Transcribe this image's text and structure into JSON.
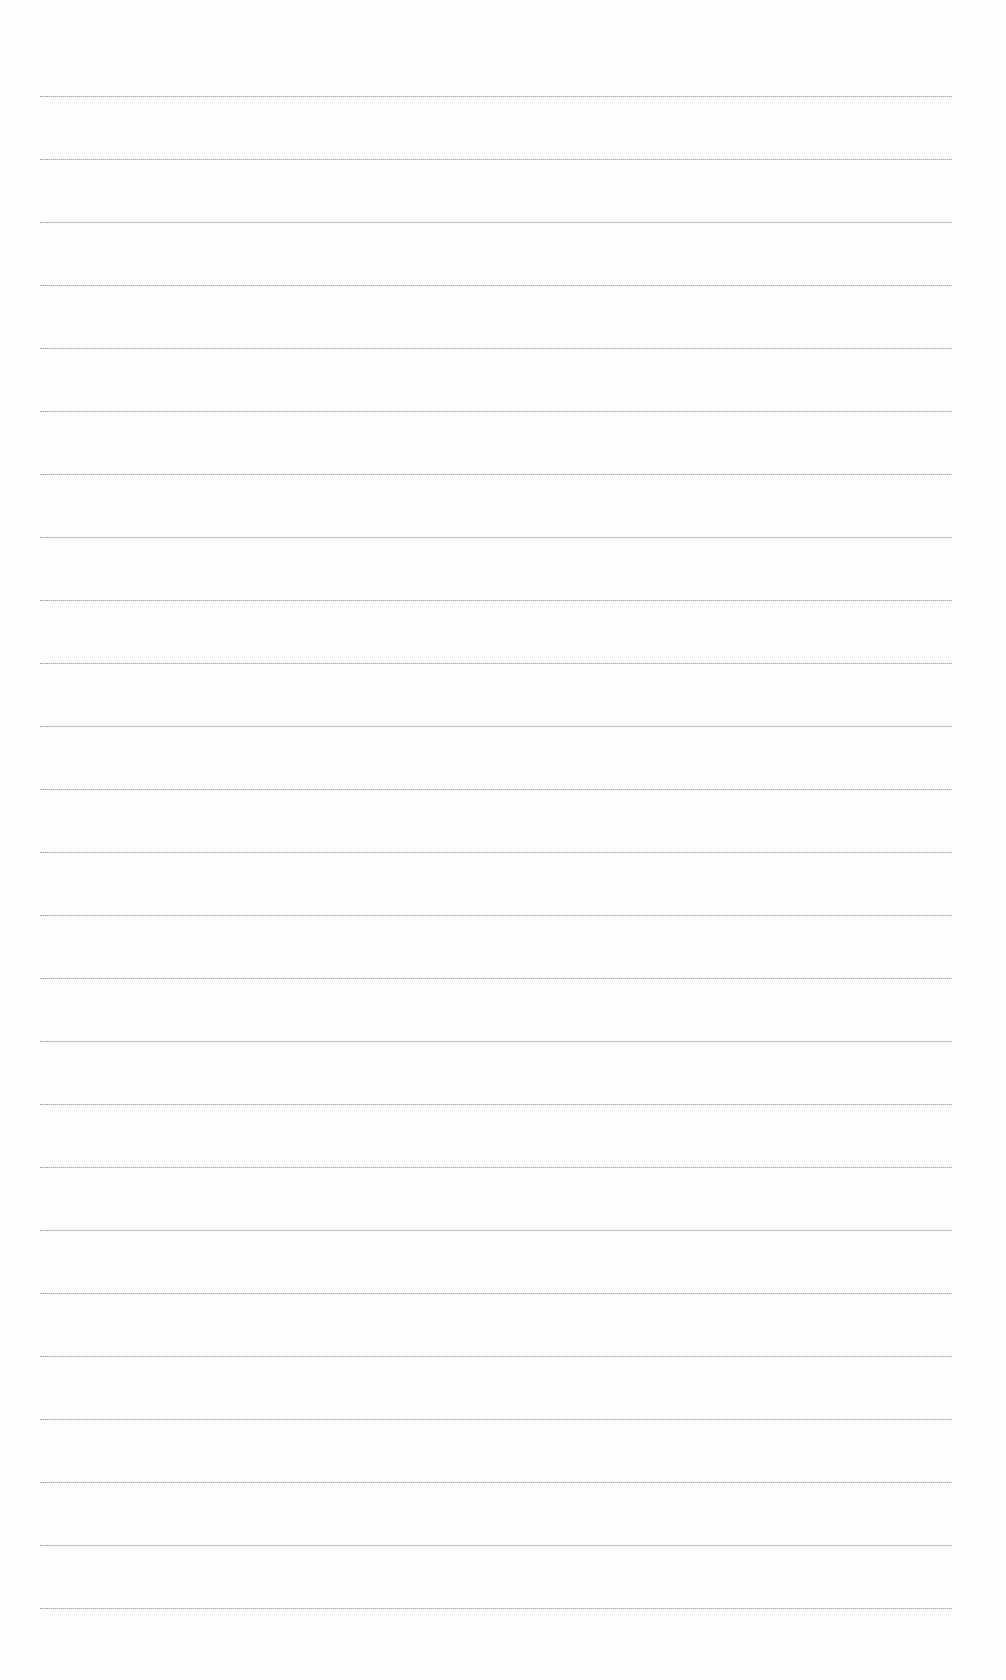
{
  "document": {
    "type": "lined-paper",
    "line_count": 25,
    "first_line_y": 96,
    "line_spacing": 63,
    "line_left": 40,
    "line_width": 912,
    "line_color": "#8a8a8a",
    "background_color": "#fefefe",
    "text": []
  }
}
